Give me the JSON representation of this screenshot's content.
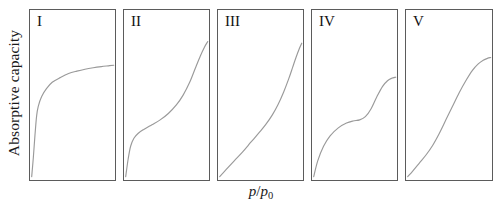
{
  "figure": {
    "axes": {
      "ylabel": "Absorptive capacity",
      "xlabel_numerator": "p",
      "xlabel_separator": "/",
      "xlabel_denominator": "p",
      "xlabel_subscript": "0",
      "xlabel_full": "p/p0"
    },
    "style": {
      "border_color": "#5b5b5b",
      "curve_color": "#9a9a9a",
      "background": "#ffffff",
      "text_color": "#1a1a1a"
    }
  },
  "chart_data": {
    "type": "line",
    "title": "",
    "xlabel": "p/p0",
    "ylabel": "Absorptive capacity",
    "xlim": [
      0,
      1
    ],
    "ylim": [
      0,
      1
    ],
    "grid": false,
    "legend": "none",
    "note": "IUPAC classification of physisorption isotherms, Types I through V. Each panel plots adsorbed amount versus relative pressure with unlabeled axes.",
    "panels": [
      {
        "label": "I",
        "description": "Langmuir type: steep initial uptake at low relative pressure followed by a long horizontal plateau.",
        "x": [
          0.0,
          0.02,
          0.04,
          0.06,
          0.08,
          0.12,
          0.18,
          0.25,
          0.35,
          0.45,
          0.55,
          0.65,
          0.75,
          0.85,
          0.95,
          1.0
        ],
        "y": [
          0.0,
          0.12,
          0.26,
          0.38,
          0.44,
          0.5,
          0.55,
          0.59,
          0.62,
          0.645,
          0.66,
          0.672,
          0.681,
          0.688,
          0.694,
          0.697
        ]
      },
      {
        "label": "II",
        "description": "Sigmoidal BET type: knee at low pressure, near-linear middle region, then sharp rise approaching saturation.",
        "x": [
          0.0,
          0.03,
          0.06,
          0.1,
          0.15,
          0.22,
          0.32,
          0.42,
          0.52,
          0.62,
          0.7,
          0.78,
          0.85,
          0.91,
          0.96,
          1.0
        ],
        "y": [
          0.0,
          0.11,
          0.19,
          0.24,
          0.27,
          0.295,
          0.325,
          0.355,
          0.395,
          0.45,
          0.51,
          0.59,
          0.68,
          0.755,
          0.81,
          0.845
        ]
      },
      {
        "label": "III",
        "description": "Convex upward throughout: weak adsorbate-adsorbent interaction, no knee, rising steeply near saturation.",
        "x": [
          0.0,
          0.08,
          0.18,
          0.28,
          0.38,
          0.48,
          0.56,
          0.64,
          0.71,
          0.78,
          0.84,
          0.89,
          0.93,
          0.97,
          1.0
        ],
        "y": [
          0.0,
          0.045,
          0.1,
          0.155,
          0.215,
          0.275,
          0.325,
          0.385,
          0.45,
          0.53,
          0.61,
          0.685,
          0.745,
          0.8,
          0.835
        ]
      },
      {
        "label": "IV",
        "description": "Two-step curve: initial rise, intermediate plateau, second rise from capillary condensation, then final plateau.",
        "x": [
          0.0,
          0.05,
          0.12,
          0.2,
          0.3,
          0.4,
          0.48,
          0.56,
          0.63,
          0.7,
          0.77,
          0.84,
          0.9,
          0.95,
          1.0
        ],
        "y": [
          0.0,
          0.1,
          0.19,
          0.255,
          0.305,
          0.335,
          0.348,
          0.355,
          0.375,
          0.425,
          0.5,
          0.565,
          0.6,
          0.615,
          0.622
        ]
      },
      {
        "label": "V",
        "description": "Sigmoid with weak initial uptake, steep central condensation step, and a final plateau near saturation.",
        "x": [
          0.0,
          0.06,
          0.14,
          0.22,
          0.3,
          0.38,
          0.46,
          0.54,
          0.62,
          0.7,
          0.78,
          0.85,
          0.91,
          0.96,
          1.0
        ],
        "y": [
          0.0,
          0.035,
          0.085,
          0.135,
          0.195,
          0.27,
          0.355,
          0.44,
          0.525,
          0.6,
          0.665,
          0.705,
          0.728,
          0.74,
          0.745
        ]
      }
    ]
  }
}
